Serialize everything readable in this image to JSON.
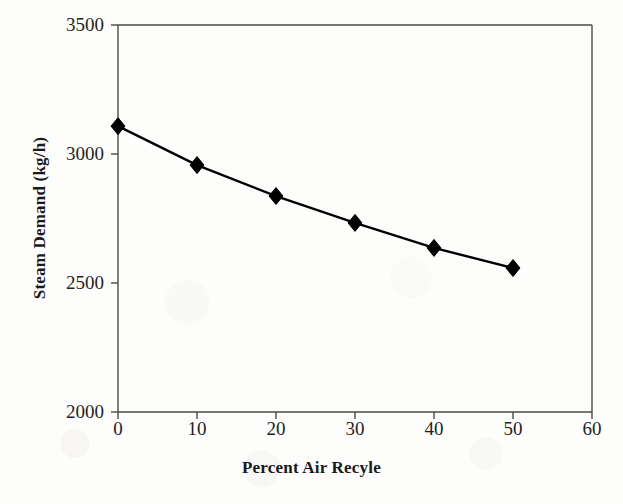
{
  "chart_data": {
    "type": "line",
    "title": "",
    "xlabel": "Percent Air Recyle",
    "ylabel": "Steam Demand (kg/h)",
    "x": [
      0,
      10,
      20,
      30,
      40,
      50
    ],
    "values": [
      3108,
      2957,
      2837,
      2733,
      2636,
      2558
    ],
    "series": [
      {
        "name": "Steam Demand",
        "x": [
          0,
          10,
          20,
          30,
          40,
          50
        ],
        "values": [
          3108,
          2957,
          2837,
          2733,
          2636,
          2558
        ],
        "marker": "diamond",
        "marker_color": "#000000",
        "line_color": "#000000"
      }
    ],
    "xlim": [
      0,
      60
    ],
    "ylim": [
      2000,
      3500
    ],
    "xticks": [
      0,
      10,
      20,
      30,
      40,
      50,
      60
    ],
    "yticks": [
      2000,
      2500,
      3000,
      3500
    ],
    "xtick_labels": [
      "0",
      "10",
      "20",
      "30",
      "40",
      "50",
      "60"
    ],
    "ytick_labels": [
      "2000",
      "2500",
      "3000",
      "3500"
    ],
    "grid": false,
    "legend": null,
    "frame": [
      "left",
      "right",
      "top",
      "bottom"
    ],
    "tick_direction": "out"
  },
  "axes": {
    "x_title": "Percent Air Recyle",
    "y_title": "Steam Demand (kg/h)",
    "x_tick_labels": [
      "0",
      "10",
      "20",
      "30",
      "40",
      "50",
      "60"
    ],
    "y_tick_labels": [
      "2000",
      "2500",
      "3000",
      "3500"
    ]
  },
  "colors": {
    "line": "#000000",
    "marker": "#000000",
    "axis": "#4a4a4a",
    "text": "#1a1a1a",
    "background": "#fdfdfc"
  }
}
